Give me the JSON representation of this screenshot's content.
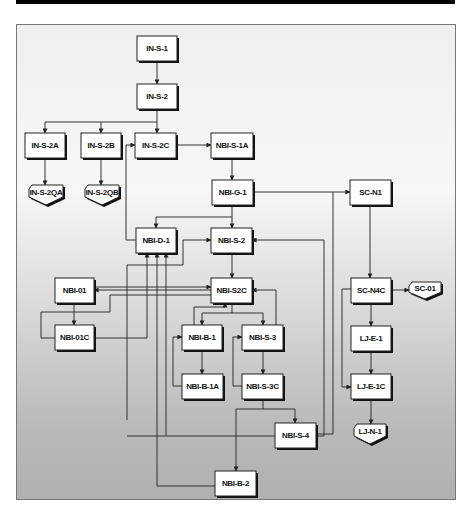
{
  "diagram": {
    "type": "flowchart",
    "nodes": [
      {
        "id": "IN-S-1",
        "label": "IN-S-1",
        "shape": "box",
        "x": 137,
        "y": 36,
        "w": 40,
        "h": 25
      },
      {
        "id": "IN-S-2",
        "label": "IN-S-2",
        "shape": "box",
        "x": 137,
        "y": 84,
        "w": 40,
        "h": 25
      },
      {
        "id": "IN-S-2A",
        "label": "IN-S-2A",
        "shape": "box",
        "x": 25,
        "y": 133,
        "w": 40,
        "h": 25
      },
      {
        "id": "IN-S-2B",
        "label": "IN-S-2B",
        "shape": "box",
        "x": 81,
        "y": 133,
        "w": 40,
        "h": 25
      },
      {
        "id": "IN-S-2C",
        "label": "IN-S-2C",
        "shape": "box",
        "x": 135,
        "y": 133,
        "w": 41,
        "h": 25
      },
      {
        "id": "NBI-S-1A",
        "label": "NBI-S-1A",
        "shape": "box",
        "x": 211,
        "y": 133,
        "w": 42,
        "h": 25
      },
      {
        "id": "IN-S-2QA",
        "label": "IN-S-2QA",
        "shape": "offpage",
        "x": 29,
        "y": 185,
        "w": 34,
        "h": 20
      },
      {
        "id": "IN-S-2QB",
        "label": "IN-S-2QB",
        "shape": "offpage",
        "x": 85,
        "y": 185,
        "w": 34,
        "h": 20
      },
      {
        "id": "NBI-G-1",
        "label": "NBI-G-1",
        "shape": "box",
        "x": 212,
        "y": 180,
        "w": 41,
        "h": 25
      },
      {
        "id": "SC-N1",
        "label": "SC-N1",
        "shape": "box",
        "x": 350,
        "y": 180,
        "w": 41,
        "h": 25
      },
      {
        "id": "NBI-D-1",
        "label": "NBI-D-1",
        "shape": "box",
        "x": 136,
        "y": 228,
        "w": 40,
        "h": 25
      },
      {
        "id": "NBI-S-2",
        "label": "NBI-S-2",
        "shape": "box",
        "x": 211,
        "y": 228,
        "w": 41,
        "h": 25
      },
      {
        "id": "NBI-01",
        "label": "NBI-01",
        "shape": "box",
        "x": 55,
        "y": 278,
        "w": 39,
        "h": 25
      },
      {
        "id": "NBI-S2C",
        "label": "NBI-S2C",
        "shape": "box",
        "x": 211,
        "y": 278,
        "w": 41,
        "h": 25
      },
      {
        "id": "SC-N4C",
        "label": "SC-N4C",
        "shape": "box",
        "x": 351,
        "y": 278,
        "w": 40,
        "h": 25
      },
      {
        "id": "SC-01",
        "label": "SC-01",
        "shape": "offpage",
        "x": 409,
        "y": 282,
        "w": 32,
        "h": 17
      },
      {
        "id": "NBI-01C",
        "label": "NBI-01C",
        "shape": "box",
        "x": 55,
        "y": 325,
        "w": 39,
        "h": 25
      },
      {
        "id": "NBI-B-1",
        "label": "NBI-B-1",
        "shape": "box",
        "x": 182,
        "y": 325,
        "w": 40,
        "h": 25
      },
      {
        "id": "NBI-S-3",
        "label": "NBI-S-3",
        "shape": "box",
        "x": 242,
        "y": 325,
        "w": 41,
        "h": 25
      },
      {
        "id": "LJ-E-1",
        "label": "LJ-E-1",
        "shape": "box",
        "x": 351,
        "y": 326,
        "w": 40,
        "h": 25
      },
      {
        "id": "NBI-B-1A",
        "label": "NBI-B-1A",
        "shape": "box",
        "x": 182,
        "y": 374,
        "w": 41,
        "h": 25
      },
      {
        "id": "NBI-S-3C",
        "label": "NBI-S-3C",
        "shape": "box",
        "x": 242,
        "y": 374,
        "w": 41,
        "h": 25
      },
      {
        "id": "LJ-E-1C",
        "label": "LJ-E-1C",
        "shape": "box",
        "x": 351,
        "y": 374,
        "w": 40,
        "h": 25
      },
      {
        "id": "NBI-S-4",
        "label": "NBI-S-4",
        "shape": "box",
        "x": 275,
        "y": 423,
        "w": 41,
        "h": 25
      },
      {
        "id": "LJ-N-1",
        "label": "LJ-N-1",
        "shape": "offpage",
        "x": 354,
        "y": 424,
        "w": 32,
        "h": 20
      },
      {
        "id": "NBI-B-2",
        "label": "NBI-B-2",
        "shape": "box",
        "x": 215,
        "y": 471,
        "w": 41,
        "h": 25
      }
    ],
    "edges": [
      {
        "from": "IN-S-1",
        "to": "IN-S-2"
      },
      {
        "from": "IN-S-2",
        "to": "IN-S-2A"
      },
      {
        "from": "IN-S-2",
        "to": "IN-S-2B"
      },
      {
        "from": "IN-S-2",
        "to": "IN-S-2C"
      },
      {
        "from": "IN-S-2A",
        "to": "IN-S-2QA"
      },
      {
        "from": "IN-S-2B",
        "to": "IN-S-2QB"
      },
      {
        "from": "IN-S-2C",
        "to": "NBI-S-1A"
      },
      {
        "from": "NBI-S-1A",
        "to": "NBI-G-1"
      },
      {
        "from": "NBI-G-1",
        "to": "SC-N1"
      },
      {
        "from": "NBI-G-1",
        "to": "NBI-S-2"
      },
      {
        "from": "NBI-G-1",
        "to": "NBI-D-1"
      },
      {
        "from": "NBI-D-1",
        "to": "IN-S-2C"
      },
      {
        "from": "SC-N1",
        "to": "SC-N4C"
      },
      {
        "from": "NBI-S-2",
        "to": "NBI-S2C"
      },
      {
        "from": "NBI-S2C",
        "to": "NBI-01"
      },
      {
        "from": "NBI-01",
        "to": "NBI-S2C"
      },
      {
        "from": "NBI-01",
        "to": "NBI-01C"
      },
      {
        "from": "NBI-01C",
        "to": "NBI-D-1"
      },
      {
        "from": "NBI-S2C",
        "to": "NBI-B-1"
      },
      {
        "from": "NBI-S2C",
        "to": "NBI-S-3"
      },
      {
        "from": "NBI-B-1",
        "to": "NBI-S2C"
      },
      {
        "from": "NBI-S-3",
        "to": "NBI-S2C"
      },
      {
        "from": "NBI-B-1",
        "to": "NBI-B-1A"
      },
      {
        "from": "NBI-B-1A",
        "to": "NBI-B-1"
      },
      {
        "from": "NBI-S-3",
        "to": "NBI-S-3C"
      },
      {
        "from": "NBI-S-3C",
        "to": "NBI-S-3"
      },
      {
        "from": "NBI-S-3C",
        "to": "NBI-S-4"
      },
      {
        "from": "NBI-S-3C",
        "to": "NBI-B-2"
      },
      {
        "from": "NBI-S-4",
        "to": "NBI-S-2"
      },
      {
        "from": "NBI-S-4",
        "to": "NBI-D-1"
      },
      {
        "from": "NBI-B-2",
        "to": "NBI-D-1"
      },
      {
        "from": "SC-N4C",
        "to": "SC-01"
      },
      {
        "from": "SC-N4C",
        "to": "LJ-E-1"
      },
      {
        "from": "SC-N4C",
        "to": "LJ-E-1C"
      },
      {
        "from": "LJ-E-1",
        "to": "LJ-E-1C"
      },
      {
        "from": "LJ-E-1C",
        "to": "LJ-N-1"
      }
    ]
  }
}
